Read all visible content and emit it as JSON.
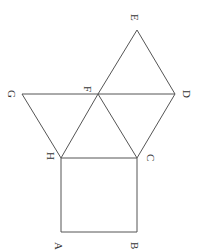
{
  "diagram": {
    "type": "geometry",
    "points": {
      "A": {
        "label": "A",
        "x": 61,
        "y": 232
      },
      "B": {
        "label": "B",
        "x": 137,
        "y": 232
      },
      "C": {
        "label": "C",
        "x": 137,
        "y": 158
      },
      "H": {
        "label": "H",
        "x": 61,
        "y": 158
      },
      "G": {
        "label": "G",
        "x": 22,
        "y": 94
      },
      "F": {
        "label": "F",
        "x": 98,
        "y": 94
      },
      "D": {
        "label": "D",
        "x": 175,
        "y": 94
      },
      "E": {
        "label": "E",
        "x": 137,
        "y": 30
      }
    },
    "segments": [
      [
        "A",
        "B"
      ],
      [
        "B",
        "C"
      ],
      [
        "C",
        "H"
      ],
      [
        "H",
        "A"
      ],
      [
        "G",
        "H"
      ],
      [
        "G",
        "F"
      ],
      [
        "H",
        "F"
      ],
      [
        "F",
        "C"
      ],
      [
        "C",
        "D"
      ],
      [
        "F",
        "D"
      ],
      [
        "F",
        "E"
      ],
      [
        "E",
        "D"
      ]
    ]
  }
}
